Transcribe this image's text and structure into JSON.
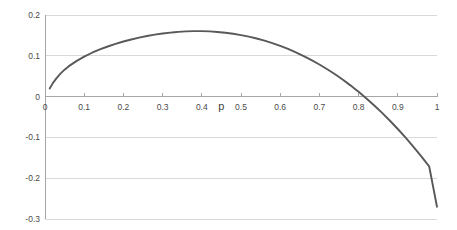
{
  "chart_data": {
    "type": "line",
    "title": "",
    "xlabel": "p",
    "ylabel": "",
    "xlim": [
      0,
      1
    ],
    "ylim": [
      -0.3,
      0.2
    ],
    "grid": true,
    "legend": null,
    "x_ticks": [
      "0",
      "0.1",
      "0.2",
      "0.3",
      "0.4",
      "0.5",
      "0.6",
      "0.7",
      "0.8",
      "0.9",
      "1"
    ],
    "x_tick_values": [
      0,
      0.1,
      0.2,
      0.3,
      0.4,
      0.5,
      0.6,
      0.7,
      0.8,
      0.9,
      1
    ],
    "y_ticks": [
      "0.2",
      "0.1",
      "0",
      "-0.1",
      "-0.2",
      "-0.3"
    ],
    "y_tick_values": [
      0.2,
      0.1,
      0,
      -0.1,
      -0.2,
      -0.3
    ],
    "line_color": "#595959",
    "grid_color": "#d9d9d9",
    "axis_color": "#a6a6a6",
    "zero_crossing": 0.79,
    "peak": {
      "x": 0.33,
      "y": 0.183
    },
    "series": [
      {
        "name": "curve",
        "x": [
          0.012,
          0.02,
          0.03,
          0.04,
          0.05,
          0.06,
          0.08,
          0.1,
          0.12,
          0.14,
          0.16,
          0.18,
          0.2,
          0.22,
          0.24,
          0.26,
          0.28,
          0.3,
          0.32,
          0.33,
          0.34,
          0.36,
          0.38,
          0.4,
          0.42,
          0.44,
          0.46,
          0.48,
          0.5,
          0.52,
          0.54,
          0.56,
          0.58,
          0.6,
          0.62,
          0.64,
          0.66,
          0.68,
          0.7,
          0.72,
          0.74,
          0.76,
          0.78,
          0.79,
          0.8,
          0.82,
          0.84,
          0.86,
          0.88,
          0.9,
          0.92,
          0.94,
          0.96,
          0.98,
          1.0
        ],
        "y": [
          0.02,
          0.033,
          0.046,
          0.057,
          0.066,
          0.074,
          0.087,
          0.098,
          0.1075,
          0.1155,
          0.1228,
          0.1292,
          0.135,
          0.14,
          0.1444,
          0.1484,
          0.1518,
          0.1546,
          0.1569,
          0.1578,
          0.1586,
          0.1598,
          0.1604,
          0.1604,
          0.1598,
          0.1585,
          0.1566,
          0.154,
          0.1508,
          0.1469,
          0.1423,
          0.137,
          0.131,
          0.1242,
          0.1167,
          0.1084,
          0.0993,
          0.0894,
          0.0787,
          0.0671,
          0.0546,
          0.0412,
          0.0269,
          0.0194,
          0.0117,
          -0.0045,
          -0.0218,
          -0.04,
          -0.0592,
          -0.0794,
          -0.1007,
          -0.123,
          -0.1464,
          -0.1708,
          -0.27
        ]
      }
    ]
  },
  "axis": {
    "x_title": "p"
  }
}
